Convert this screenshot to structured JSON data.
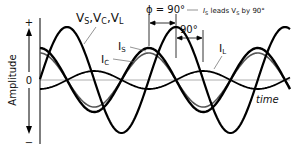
{
  "diagram": {
    "y_axis": {
      "label": "Amplitude",
      "plus": "+",
      "minus": "−",
      "zero": "0"
    },
    "x_axis": {
      "label": "time"
    },
    "phase": {
      "phi_label": "ϕ = 90°",
      "note": "IS leads VS by 90°",
      "note_parts": {
        "i": "I",
        "i_sub": "S",
        "mid": " leads ",
        "v": "V",
        "v_sub": "S",
        "end": " by 90°"
      },
      "second_marker": "90°"
    },
    "waves": [
      {
        "name": "voltage",
        "label": "VS,VC,VL",
        "label_parts": [
          "V",
          "S",
          ",V",
          "C",
          ",V",
          "L"
        ],
        "amplitude": 53,
        "phase_deg": 0,
        "stroke": "#000000",
        "width": 2.2
      },
      {
        "name": "source-current",
        "label": "IS",
        "label_parts": [
          "I",
          "S"
        ],
        "amplitude": 32,
        "phase_deg": 90,
        "stroke": "#000000",
        "width": 2.4
      },
      {
        "name": "capacitor-current",
        "label": "IC",
        "label_parts": [
          "I",
          "C"
        ],
        "amplitude": 27,
        "phase_deg": 90,
        "stroke": "#555555",
        "width": 1.6
      },
      {
        "name": "inductor-current",
        "label": "IL",
        "label_parts": [
          "I",
          "L"
        ],
        "amplitude": 9,
        "phase_deg": -90,
        "stroke": "#000000",
        "width": 1.8
      }
    ],
    "geometry": {
      "origin_x": 40,
      "zero_y": 80,
      "period_px": 109,
      "x_end": 290,
      "v_peak_x": 67
    },
    "colors": {
      "axis": "#000000",
      "zero_line": "#999999",
      "leader": "#666666",
      "text": "#111111"
    }
  }
}
